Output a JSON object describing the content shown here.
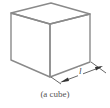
{
  "figure": {
    "shape": "cube",
    "caption": "(a cube)",
    "dimension_label": "l",
    "edge_color": "#8a8a8a",
    "arrow_color": "#333333"
  }
}
